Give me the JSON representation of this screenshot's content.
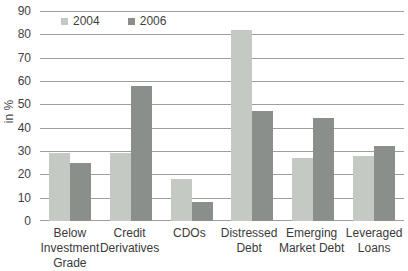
{
  "chart_data": {
    "type": "bar",
    "title": "",
    "ylabel": "in %",
    "xlabel": "",
    "ylim": [
      0,
      90
    ],
    "yticks": [
      0,
      10,
      20,
      30,
      40,
      50,
      60,
      70,
      80,
      90
    ],
    "grid": true,
    "legend_position": "top-left-inside",
    "categories": [
      "Below Investment Grade",
      "Credit Derivatives",
      "CDOs",
      "Distressed Debt",
      "Emerging Market Debt",
      "Leveraged Loans"
    ],
    "category_lines": [
      [
        "Below",
        "Investment",
        "Grade"
      ],
      [
        "Credit",
        "Derivatives"
      ],
      [
        "CDOs"
      ],
      [
        "Distressed",
        "Debt"
      ],
      [
        "Emerging",
        "Market Debt"
      ],
      [
        "Leveraged",
        "Loans"
      ]
    ],
    "series": [
      {
        "name": "2004",
        "color": "#c5c9c3",
        "values": [
          29,
          29,
          18,
          82,
          27,
          28
        ]
      },
      {
        "name": "2006",
        "color": "#8b8f8c",
        "values": [
          25,
          58,
          8,
          47,
          44,
          32
        ]
      }
    ]
  },
  "colors": {
    "background": "#ffffff",
    "gridline": "#9e9e9e",
    "axis_text": "#3f3f3f",
    "series_2004": "#c5c9c3",
    "series_2006": "#8b8f8c"
  }
}
